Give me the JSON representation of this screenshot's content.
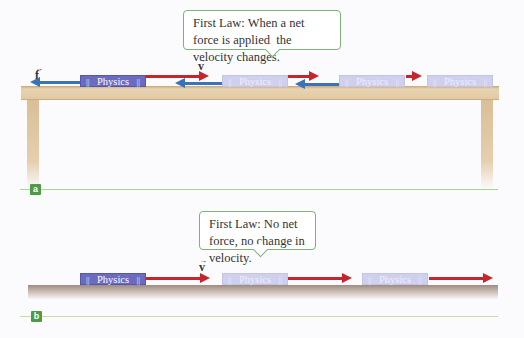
{
  "colors": {
    "force_arrow": "#3b73b9",
    "velocity_arrow": "#c4262b",
    "book_solid": "#6a6bc1",
    "book_ghost": "#cfd0ee",
    "table_wood": "#e2c9a2",
    "floor": "#a8958c",
    "callout_border": "#7fb27a",
    "panel_label_bg": "#4f9a45",
    "divider": "#a9d48e"
  },
  "panel_a": {
    "label": "a",
    "callout": "First Law: When a net force is applied, the velocity changes.",
    "force_symbol": "f",
    "velocity_symbol": "v",
    "books": [
      "Physics",
      "Physics",
      "Physics",
      "Physics"
    ]
  },
  "panel_b": {
    "label": "b",
    "callout": "First Law: No net force, no change in velocity.",
    "velocity_symbol": "v",
    "books": [
      "Physics",
      "Physics",
      "Physics"
    ]
  },
  "book_bars": "||"
}
